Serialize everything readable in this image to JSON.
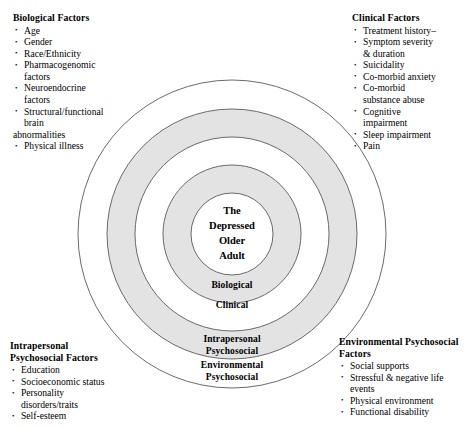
{
  "diagram": {
    "center": {
      "lines": [
        "The",
        "Depressed",
        "Older",
        "Adult"
      ]
    },
    "rings": [
      {
        "name": "biological",
        "label": "Biological"
      },
      {
        "name": "clinical",
        "label": "Clinical"
      },
      {
        "name": "intrapersonal",
        "label_line1": "Intrapersonal",
        "label_line2": "Psychosocial"
      },
      {
        "name": "environmental",
        "label_line1": "Environmental",
        "label_line2": "Psychosocial"
      }
    ],
    "colors": {
      "ring_shaded": "#e2e2e2",
      "ring_plain": "#ffffff",
      "stroke": "#4a4a4a",
      "text": "#000000",
      "background": "#ffffff"
    }
  },
  "blocks": {
    "biological": {
      "heading": "Biological Factors",
      "items": [
        "Age",
        "Gender",
        "Race/Ethnicity",
        "Pharmacogenomic",
        "factors",
        "Neuroendocrine",
        "factors",
        "Structural/functional",
        "brain",
        "abnormalities",
        "Physical illness"
      ]
    },
    "clinical": {
      "heading": "Clinical Factors",
      "items": [
        "Treatment history–",
        "Symptom severity",
        "& duration",
        "Suicidality",
        "Co-morbid anxiety",
        "Co-morbid",
        "substance abuse",
        "Cognitive",
        "impairment",
        "Sleep impairment",
        "Pain"
      ]
    },
    "intrapersonal": {
      "heading_line1": "Intrapersonal",
      "heading_line2": "Psychosocial Factors",
      "items": [
        "Education",
        "Socioeconomic status",
        "Personality",
        "disorders/traits",
        "Self-esteem"
      ]
    },
    "environmental": {
      "heading_line1": "Environmental Psychosocial",
      "heading_line2": "Factors",
      "items": [
        "Social supports",
        "Stressful & negative life",
        "events",
        "Physical environment",
        "Functional disability"
      ]
    }
  }
}
